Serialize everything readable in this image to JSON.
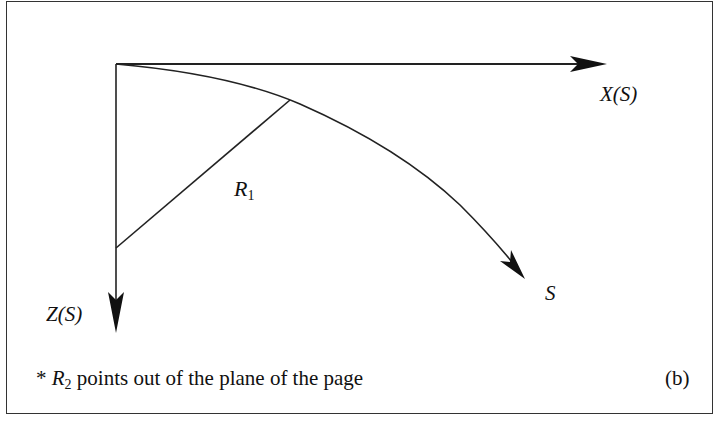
{
  "diagram": {
    "panel_tag": "(b)",
    "labels": {
      "x_axis": "X(S)",
      "z_axis": "Z(S)",
      "curve": "S",
      "r1_main": "R",
      "r1_sub": "1"
    },
    "note": {
      "prefix": "* ",
      "symbol": "R",
      "symbol_sub": "2",
      "text": " points out of the plane of the page"
    },
    "colors": {
      "line": "#222222",
      "background": "#ffffff"
    }
  }
}
